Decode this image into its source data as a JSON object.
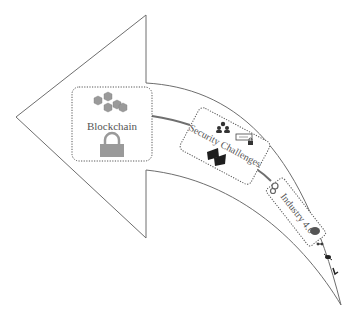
{
  "diagram": {
    "type": "curved-arrow-flow",
    "direction": "right-to-left",
    "colors": {
      "outline": "#6e6e6e",
      "box_border": "#555555",
      "connector": "#7a7a7a",
      "icon_gray": "#9a9a9a",
      "icon_dark": "#2a2a2a",
      "text": "#555555"
    },
    "nodes": [
      {
        "id": "blockchain",
        "label": "Blockchain",
        "icons": [
          "blockchain-cubes-icon",
          "padlock-icon"
        ]
      },
      {
        "id": "security",
        "label": "Security Challenges",
        "icons": [
          "users-group-icon",
          "password-lock-icon",
          "computers-icon"
        ]
      },
      {
        "id": "industry",
        "label": "Industry 4.0",
        "icons": [
          "gears-icon",
          "brain-icon"
        ]
      }
    ],
    "tail_icons": [
      "robot-arm-icon",
      "drone-icon",
      "industrial-robot-icon"
    ]
  }
}
